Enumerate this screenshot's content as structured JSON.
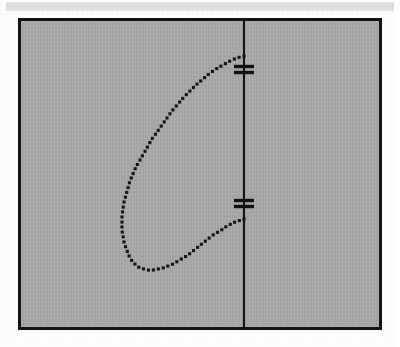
{
  "page": {
    "background_color": "#fefefe",
    "header_band": {
      "label": "scan-header-band",
      "color": "#dedede"
    }
  },
  "figure": {
    "title": "",
    "frame": {
      "border_color": "#141414",
      "border_width_px": 3,
      "fill_color": "#a9a9a9",
      "x": 18,
      "y": 18,
      "width": 364,
      "height": 312
    },
    "axis": {
      "name": "vertical-symmetry-axis",
      "color": "#141414",
      "x_px": 223,
      "y_top_px": 0,
      "y_bottom_px": 306
    },
    "ticks": [
      {
        "label": "upper-double-hash-tick",
        "y_px": 48,
        "style": "double-hash",
        "half_width_px": 10
      },
      {
        "label": "lower-double-hash-tick",
        "y_px": 182,
        "style": "double-hash",
        "half_width_px": 10
      }
    ],
    "curve": {
      "name": "dotted-teardrop-curve",
      "style": "dotted",
      "dot_color": "#161616",
      "dot_size_px": 3.1,
      "dot_count": 78,
      "endpoint_top": {
        "x_px": 223,
        "y_px": 35
      },
      "endpoint_bottom": {
        "x_px": 223,
        "y_px": 198
      },
      "leftmost_x_px": 101,
      "bottom_y_px": 249
    }
  },
  "chart_data": {
    "type": "scatter",
    "title": "",
    "xlabel": "",
    "ylabel": "",
    "grid": false,
    "legend": null,
    "xlim": [
      0,
      364
    ],
    "ylim": [
      0,
      312
    ],
    "annotations": [
      {
        "text": "",
        "kind": "double-hash-tick",
        "x": 223,
        "y": 48
      },
      {
        "text": "",
        "kind": "double-hash-tick",
        "x": 223,
        "y": 182
      }
    ],
    "series": [
      {
        "name": "vertical-axis-line",
        "kind": "line",
        "x": [
          223,
          223
        ],
        "y": [
          0,
          306
        ]
      },
      {
        "name": "dotted-teardrop-curve",
        "kind": "scatter",
        "x": [
          223,
          216,
          209,
          202,
          195,
          188,
          182,
          175,
          169,
          163,
          157,
          151,
          146,
          141,
          136,
          131,
          127,
          123,
          119,
          115,
          112,
          109,
          107,
          105,
          103,
          102,
          101,
          101,
          101,
          102,
          103,
          105,
          107,
          109,
          112,
          115,
          119,
          123,
          127,
          132,
          137,
          142,
          147,
          152,
          157,
          162,
          167,
          172,
          177,
          182,
          187,
          192,
          197,
          202,
          206,
          210,
          214,
          217,
          220,
          222,
          223
        ],
        "y": [
          35,
          37,
          40,
          44,
          48,
          53,
          58,
          64,
          70,
          76,
          83,
          90,
          97,
          104,
          111,
          118,
          125,
          132,
          139,
          146,
          153,
          160,
          167,
          174,
          181,
          188,
          195,
          202,
          209,
          215,
          221,
          227,
          232,
          237,
          241,
          244,
          247,
          248,
          249,
          249,
          248,
          247,
          245,
          243,
          240,
          237,
          234,
          230,
          226,
          222,
          218,
          214,
          211,
          208,
          205,
          203,
          201,
          200,
          199,
          198,
          198
        ]
      }
    ]
  }
}
